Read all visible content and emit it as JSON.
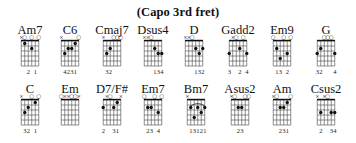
{
  "title": "(Capo 3rd fret)",
  "chords": [
    {
      "name": "Am7",
      "row": 0,
      "cx": 30,
      "markers": [
        "x",
        "o",
        "",
        "o",
        "",
        "o"
      ],
      "dots": [
        [
          4,
          2
        ],
        [
          2,
          1
        ]
      ],
      "barre": null,
      "fingering": [
        "",
        "",
        "2",
        "",
        "1",
        ""
      ]
    },
    {
      "name": "C6",
      "row": 0,
      "cx": 70,
      "markers": [
        "x",
        "",
        "",
        "",
        "",
        "o"
      ],
      "dots": [
        [
          2,
          3
        ],
        [
          3,
          2
        ],
        [
          4,
          2
        ],
        [
          5,
          1
        ]
      ],
      "barre": null,
      "fingering": [
        "",
        "4",
        "2",
        "3",
        "1",
        ""
      ]
    },
    {
      "name": "Cmaj7",
      "row": 0,
      "cx": 112,
      "markers": [
        "x",
        "",
        "",
        "o",
        "o",
        "o"
      ],
      "dots": [
        [
          2,
          3
        ],
        [
          3,
          2
        ]
      ],
      "barre": null,
      "fingering": [
        "",
        "3",
        "2",
        "",
        "",
        ""
      ]
    },
    {
      "name": "Dsus4",
      "row": 0,
      "cx": 153,
      "markers": [
        "x",
        "x",
        "o",
        "",
        "",
        ""
      ],
      "dots": [
        [
          4,
          2
        ],
        [
          5,
          3
        ],
        [
          6,
          3
        ]
      ],
      "barre": null,
      "fingering": [
        "",
        "",
        "",
        "1",
        "3",
        "4"
      ]
    },
    {
      "name": "D",
      "row": 0,
      "cx": 194,
      "markers": [
        "x",
        "x",
        "o",
        "",
        "",
        ""
      ],
      "dots": [
        [
          4,
          2
        ],
        [
          5,
          3
        ],
        [
          6,
          2
        ]
      ],
      "barre": null,
      "fingering": [
        "",
        "",
        "",
        "1",
        "3",
        "2"
      ]
    },
    {
      "name": "Gadd2",
      "row": 0,
      "cx": 238,
      "markers": [
        "",
        "x",
        "o",
        "",
        "o",
        ""
      ],
      "dots": [
        [
          1,
          3
        ],
        [
          4,
          2
        ],
        [
          6,
          3
        ]
      ],
      "barre": null,
      "fingering": [
        "3",
        "",
        "",
        "2",
        "",
        "4"
      ]
    },
    {
      "name": "Em9",
      "row": 0,
      "cx": 282,
      "markers": [
        "o",
        "",
        "",
        "o",
        "",
        "o"
      ],
      "dots": [
        [
          2,
          2
        ],
        [
          3,
          4
        ],
        [
          5,
          3
        ]
      ],
      "barre": null,
      "fingering": [
        "",
        "1",
        "3",
        "",
        "2",
        ""
      ]
    },
    {
      "name": "G",
      "row": 0,
      "cx": 326,
      "markers": [
        "",
        "",
        "o",
        "o",
        "o",
        ""
      ],
      "dots": [
        [
          1,
          3
        ],
        [
          2,
          2
        ],
        [
          6,
          3
        ]
      ],
      "barre": null,
      "fingering": [
        "3",
        "2",
        "",
        "",
        "",
        "4"
      ]
    },
    {
      "name": "C",
      "row": 1,
      "cx": 30,
      "markers": [
        "x",
        "",
        "",
        "o",
        "",
        "o"
      ],
      "dots": [
        [
          2,
          3
        ],
        [
          3,
          2
        ],
        [
          5,
          1
        ]
      ],
      "barre": null,
      "fingering": [
        "",
        "3",
        "2",
        "",
        "1",
        ""
      ]
    },
    {
      "name": "Em",
      "row": 1,
      "cx": 70,
      "markers": [
        "o",
        "x",
        "x",
        "o",
        "o",
        "x"
      ],
      "dots": [],
      "barre": null,
      "fingering": [
        "",
        "",
        "",
        "",
        "",
        ""
      ]
    },
    {
      "name": "D7/F#",
      "row": 1,
      "cx": 112,
      "markers": [
        "",
        "x",
        "o",
        "",
        "",
        "x"
      ],
      "dots": [
        [
          1,
          2
        ],
        [
          4,
          2
        ],
        [
          5,
          1
        ]
      ],
      "barre": null,
      "fingering": [
        "2",
        "",
        "",
        "3",
        "1",
        ""
      ]
    },
    {
      "name": "Em7",
      "row": 1,
      "cx": 153,
      "markers": [
        "o",
        "",
        "",
        "o",
        "",
        "o"
      ],
      "dots": [
        [
          2,
          2
        ],
        [
          3,
          2
        ],
        [
          5,
          3
        ]
      ],
      "barre": null,
      "fingering": [
        "",
        "2",
        "3",
        "",
        "4",
        ""
      ]
    },
    {
      "name": "Bm7",
      "row": 1,
      "cx": 196,
      "markers": [
        "x",
        "",
        "",
        "",
        "",
        ""
      ],
      "dots": [
        [
          2,
          2
        ],
        [
          3,
          4
        ],
        [
          4,
          2
        ],
        [
          5,
          3
        ],
        [
          6,
          2
        ]
      ],
      "barre": [
        2,
        6,
        2
      ],
      "fingering": [
        "",
        "1",
        "3",
        "1",
        "2",
        "1"
      ]
    },
    {
      "name": "Asus2",
      "row": 1,
      "cx": 240,
      "markers": [
        "x",
        "o",
        "",
        "",
        "o",
        "o"
      ],
      "dots": [
        [
          3,
          2
        ],
        [
          4,
          2
        ]
      ],
      "barre": null,
      "fingering": [
        "",
        "",
        "2",
        "3",
        "",
        ""
      ]
    },
    {
      "name": "Am",
      "row": 1,
      "cx": 282,
      "markers": [
        "x",
        "o",
        "",
        "",
        "",
        "o"
      ],
      "dots": [
        [
          3,
          2
        ],
        [
          4,
          2
        ],
        [
          5,
          1
        ]
      ],
      "barre": null,
      "fingering": [
        "",
        "",
        "2",
        "3",
        "1",
        ""
      ]
    },
    {
      "name": "Csus2",
      "row": 1,
      "cx": 326,
      "markers": [
        "x",
        "",
        "x",
        "o",
        "",
        ""
      ],
      "dots": [
        [
          2,
          3
        ],
        [
          5,
          3
        ],
        [
          6,
          3
        ]
      ],
      "barre": null,
      "fingering": [
        "",
        "2",
        "",
        "",
        "3",
        "4"
      ]
    }
  ]
}
